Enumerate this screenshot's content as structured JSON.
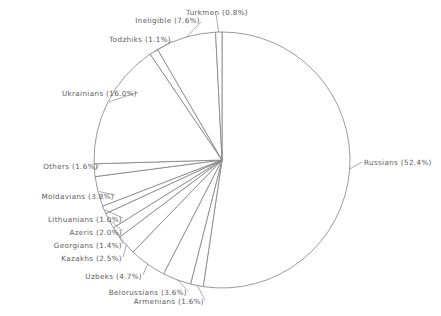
{
  "chart_data": {
    "type": "pie",
    "title": "",
    "subtitle": "",
    "xlabel": "",
    "ylabel": "",
    "legend_position": "none",
    "grid": false,
    "units": "percent",
    "label_format": "{name} ({value}%)",
    "start_angle_deg": -90,
    "direction": "clockwise",
    "total": 100.0,
    "center": {
      "x": 222,
      "y": 160
    },
    "radius": 128,
    "categories": [
      "Russians",
      "Armenians",
      "Belorussians",
      "Uzbeks",
      "Kazakhs",
      "Georgians",
      "Azeris",
      "Lithuanians",
      "Moldavians",
      "Others",
      "Ukrainians",
      "Todzhiks",
      "Ineligible",
      "Turkmen"
    ],
    "values": [
      52.4,
      1.6,
      3.6,
      4.7,
      2.5,
      1.4,
      2.0,
      1.0,
      3.8,
      1.6,
      16.0,
      1.1,
      7.6,
      0.8
    ],
    "slices": [
      {
        "name": "Russians",
        "value": 52.4,
        "label": "Russians (52.4%)",
        "side": "right"
      },
      {
        "name": "Armenians",
        "value": 1.6,
        "label": "Armenians (1.6%)",
        "side": "left"
      },
      {
        "name": "Belorussians",
        "value": 3.6,
        "label": "Belorussians (3.6%)",
        "side": "left"
      },
      {
        "name": "Uzbeks",
        "value": 4.7,
        "label": "Uzbeks (4.7%)",
        "side": "left"
      },
      {
        "name": "Kazakhs",
        "value": 2.5,
        "label": "Kazakhs (2.5%)",
        "side": "left"
      },
      {
        "name": "Georgians",
        "value": 1.4,
        "label": "Georgians (1.4%)",
        "side": "left"
      },
      {
        "name": "Azeris",
        "value": 2.0,
        "label": "Azeris (2.0%)",
        "side": "left"
      },
      {
        "name": "Lithuanians",
        "value": 1.0,
        "label": "Lithuanians (1.0%)",
        "side": "left"
      },
      {
        "name": "Moldavians",
        "value": 3.8,
        "label": "Moldavians (3.8%)",
        "side": "left"
      },
      {
        "name": "Others",
        "value": 1.6,
        "label": "Others (1.6%)",
        "side": "left"
      },
      {
        "name": "Ukrainians",
        "value": 16.0,
        "label": "Ukrainians (16.0%)",
        "side": "left"
      },
      {
        "name": "Todzhiks",
        "value": 1.1,
        "label": "Todzhiks (1.1%)",
        "side": "left"
      },
      {
        "name": "Ineligible",
        "value": 7.6,
        "label": "Ineligible (7.6%)",
        "side": "left"
      },
      {
        "name": "Turkmen",
        "value": 0.8,
        "label": "Turkmen (0.8%)",
        "side": "top"
      }
    ],
    "colors": {
      "background": "#ffffff",
      "slice_fill": "#ffffff",
      "slice_stroke": "#808080",
      "leader_line": "#8a8a8a",
      "label_text": "#5a5a5a"
    }
  },
  "labels": {
    "russians": "Russians (52.4%)",
    "armenians": "Armenians (1.6%)",
    "belorussians": "Belorussians (3.6%)",
    "uzbeks": "Uzbeks (4.7%)",
    "kazakhs": "Kazakhs (2.5%)",
    "georgians": "Georgians (1.4%)",
    "azeris": "Azeris (2.0%)",
    "lithuanians": "Lithuanians (1.0%)",
    "moldavians": "Moldavians (3.8%)",
    "others": "Others (1.6%)",
    "ukrainians": "Ukrainians (16.0%)",
    "todzhiks": "Todzhiks (1.1%)",
    "ineligible": "Ineligible (7.6%)",
    "turkmen": "Turkmen (0.8%)"
  }
}
